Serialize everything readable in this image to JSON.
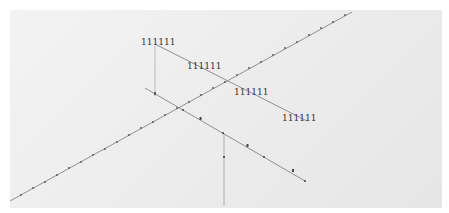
{
  "diagram": {
    "labels": [
      {
        "text": "111111",
        "x": 141,
        "y": 45
      },
      {
        "text": "111111",
        "x": 187,
        "y": 69
      },
      {
        "text": "111111",
        "x": 234,
        "y": 95
      },
      {
        "text": "111111",
        "x": 282,
        "y": 121
      }
    ],
    "colors": {
      "line": "#6a6a6a",
      "tick": "#444444",
      "background": "#eeeeee",
      "border": "#ffffff"
    }
  }
}
